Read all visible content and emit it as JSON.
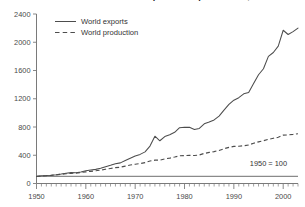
{
  "chart": {
    "title": "Growth in world merchandise exports and production, 1950-2003",
    "note": "1950 = 100",
    "legend": {
      "exports_label": "World exports",
      "production_label": "World production"
    },
    "y_ticks": [
      "0",
      "400",
      "800",
      "1200",
      "1600",
      "2000",
      "2400"
    ],
    "x_ticks": [
      "1950",
      "1960",
      "1970",
      "1980",
      "1990",
      "2000"
    ],
    "colors": {
      "line": "#4d4d4d",
      "axis": "#7a7a7a",
      "baseline": "#8a8a8a",
      "background": "#ffffff"
    }
  },
  "chart_data": {
    "type": "line",
    "title": "Growth in world merchandise exports and production, 1950-2003",
    "subtitle": "1950 = 100",
    "xlabel": "",
    "ylabel": "",
    "xlim": [
      1950,
      2003
    ],
    "ylim": [
      0,
      2400
    ],
    "grid": false,
    "legend_position": "top-left",
    "annotations": [
      {
        "text": "1950 = 100",
        "x": 1998,
        "y": 150
      }
    ],
    "reference_lines": [
      {
        "value": 100,
        "orientation": "horizontal",
        "label": "1950 = 100"
      }
    ],
    "x": [
      1950,
      1951,
      1952,
      1953,
      1954,
      1955,
      1956,
      1957,
      1958,
      1959,
      1960,
      1961,
      1962,
      1963,
      1964,
      1965,
      1966,
      1967,
      1968,
      1969,
      1970,
      1971,
      1972,
      1973,
      1974,
      1975,
      1976,
      1977,
      1978,
      1979,
      1980,
      1981,
      1982,
      1983,
      1984,
      1985,
      1986,
      1987,
      1988,
      1989,
      1990,
      1991,
      1992,
      1993,
      1994,
      1995,
      1996,
      1997,
      1998,
      1999,
      2000,
      2001,
      2002,
      2003
    ],
    "series": [
      {
        "name": "World exports",
        "style": "solid",
        "values": [
          100,
          110,
          112,
          116,
          124,
          134,
          146,
          154,
          152,
          164,
          180,
          190,
          200,
          215,
          238,
          258,
          280,
          292,
          325,
          358,
          390,
          412,
          448,
          530,
          670,
          605,
          665,
          690,
          725,
          790,
          795,
          795,
          765,
          780,
          845,
          870,
          900,
          955,
          1040,
          1120,
          1180,
          1215,
          1270,
          1290,
          1415,
          1540,
          1625,
          1800,
          1855,
          1945,
          2170,
          2110,
          2150,
          2200
        ]
      },
      {
        "name": "World production",
        "style": "dashed",
        "values": [
          100,
          106,
          110,
          116,
          122,
          130,
          138,
          144,
          146,
          156,
          164,
          172,
          181,
          190,
          202,
          213,
          224,
          231,
          246,
          262,
          272,
          282,
          296,
          318,
          330,
          330,
          348,
          360,
          375,
          392,
          396,
          398,
          396,
          404,
          426,
          440,
          452,
          468,
          492,
          512,
          525,
          528,
          535,
          545,
          570,
          590,
          605,
          625,
          640,
          655,
          685,
          688,
          695,
          705
        ]
      }
    ]
  }
}
